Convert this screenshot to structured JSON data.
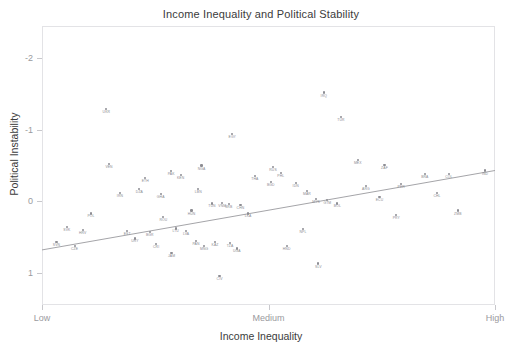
{
  "chart": {
    "title": "Income Inequality and Political Stability",
    "xlabel": "Income Inequality",
    "ylabel": "Political Instability"
  },
  "chart_data": {
    "type": "scatter",
    "title": "Income Inequality and Political Stability",
    "xlabel": "Income Inequality",
    "ylabel": "Political Instability",
    "grid": false,
    "legend": null,
    "xtick_labels": [
      "Low",
      "Medium",
      "High"
    ],
    "xtick_values": [
      0,
      0.5,
      1
    ],
    "ytick_labels": [
      "-2",
      "-1",
      "0",
      "1"
    ],
    "ytick_values": [
      -2,
      -1,
      0,
      1
    ],
    "y_axis_inverted": true,
    "xlim": [
      0,
      1
    ],
    "ylim": [
      -2.45,
      1.45
    ],
    "point_color": "#8d8d93",
    "label_color": "#8a8a90",
    "trendline": {
      "type": "linear",
      "color": "#9a9a9e",
      "x_start": 0.0,
      "y_start": 0.68,
      "x_end": 1.0,
      "y_end": -0.43
    },
    "points": [
      {
        "label": "UKR",
        "x": 0.142,
        "y": -1.29
      },
      {
        "label": "EGY",
        "x": 0.42,
        "y": -0.94
      },
      {
        "label": "IRQ",
        "x": 0.622,
        "y": -1.52
      },
      {
        "label": "TUR",
        "x": 0.66,
        "y": -1.18
      },
      {
        "label": "VEN",
        "x": 0.148,
        "y": -0.52
      },
      {
        "label": "NGA",
        "x": 0.352,
        "y": -0.5
      },
      {
        "label": "MEX",
        "x": 0.697,
        "y": -0.58
      },
      {
        "label": "RUS",
        "x": 0.51,
        "y": -0.48
      },
      {
        "label": "ZAF",
        "x": 0.756,
        "y": -0.51
      },
      {
        "label": "BRA",
        "x": 0.845,
        "y": -0.38
      },
      {
        "label": "COL",
        "x": 0.898,
        "y": -0.38
      },
      {
        "label": "IND",
        "x": 0.978,
        "y": -0.43
      },
      {
        "label": "PAK",
        "x": 0.285,
        "y": -0.42
      },
      {
        "label": "KEN",
        "x": 0.306,
        "y": -0.37
      },
      {
        "label": "PHL",
        "x": 0.527,
        "y": -0.4
      },
      {
        "label": "ETH",
        "x": 0.228,
        "y": -0.33
      },
      {
        "label": "THA",
        "x": 0.47,
        "y": -0.35
      },
      {
        "label": "BGD",
        "x": 0.505,
        "y": -0.27
      },
      {
        "label": "IDN",
        "x": 0.56,
        "y": -0.26
      },
      {
        "label": "PER",
        "x": 0.793,
        "y": -0.24
      },
      {
        "label": "ARG",
        "x": 0.715,
        "y": -0.21
      },
      {
        "label": "LBN",
        "x": 0.345,
        "y": -0.17
      },
      {
        "label": "DZA",
        "x": 0.215,
        "y": -0.17
      },
      {
        "label": "MAR",
        "x": 0.585,
        "y": -0.14
      },
      {
        "label": "CHL",
        "x": 0.872,
        "y": -0.12
      },
      {
        "label": "IRN",
        "x": 0.172,
        "y": -0.11
      },
      {
        "label": "GHA",
        "x": 0.262,
        "y": -0.1
      },
      {
        "label": "MYS",
        "x": 0.605,
        "y": -0.03
      },
      {
        "label": "GTM",
        "x": 0.63,
        "y": -0.02
      },
      {
        "label": "ECU",
        "x": 0.745,
        "y": -0.06
      },
      {
        "label": "BOL",
        "x": 0.652,
        "y": 0.03
      },
      {
        "label": "VNM",
        "x": 0.398,
        "y": 0.02
      },
      {
        "label": "TUN",
        "x": 0.375,
        "y": 0.03
      },
      {
        "label": "SRB",
        "x": 0.412,
        "y": 0.04
      },
      {
        "label": "CHN",
        "x": 0.438,
        "y": 0.05
      },
      {
        "label": "POL",
        "x": 0.108,
        "y": 0.17
      },
      {
        "label": "ZMB",
        "x": 0.918,
        "y": 0.13
      },
      {
        "label": "PRY",
        "x": 0.782,
        "y": 0.19
      },
      {
        "label": "HUN",
        "x": 0.33,
        "y": 0.13
      },
      {
        "label": "LKA",
        "x": 0.455,
        "y": 0.17
      },
      {
        "label": "ROU",
        "x": 0.268,
        "y": 0.22
      },
      {
        "label": "SVK",
        "x": 0.055,
        "y": 0.36
      },
      {
        "label": "HRV",
        "x": 0.09,
        "y": 0.4
      },
      {
        "label": "EST",
        "x": 0.188,
        "y": 0.41
      },
      {
        "label": "BGR",
        "x": 0.238,
        "y": 0.43
      },
      {
        "label": "LTU",
        "x": 0.295,
        "y": 0.38
      },
      {
        "label": "LVA",
        "x": 0.318,
        "y": 0.41
      },
      {
        "label": "NPL",
        "x": 0.576,
        "y": 0.39
      },
      {
        "label": "SVN",
        "x": 0.032,
        "y": 0.57
      },
      {
        "label": "CZE",
        "x": 0.072,
        "y": 0.63
      },
      {
        "label": "URY",
        "x": 0.205,
        "y": 0.52
      },
      {
        "label": "CRI",
        "x": 0.252,
        "y": 0.6
      },
      {
        "label": "PAN",
        "x": 0.34,
        "y": 0.55
      },
      {
        "label": "KAZ",
        "x": 0.382,
        "y": 0.57
      },
      {
        "label": "TZA",
        "x": 0.415,
        "y": 0.58
      },
      {
        "label": "MNG",
        "x": 0.358,
        "y": 0.63
      },
      {
        "label": "UGA",
        "x": 0.43,
        "y": 0.66
      },
      {
        "label": "JAM",
        "x": 0.286,
        "y": 0.72
      },
      {
        "label": "HND",
        "x": 0.54,
        "y": 0.62
      },
      {
        "label": "SLV",
        "x": 0.61,
        "y": 0.87
      },
      {
        "label": "CIV",
        "x": 0.392,
        "y": 1.04
      }
    ]
  }
}
